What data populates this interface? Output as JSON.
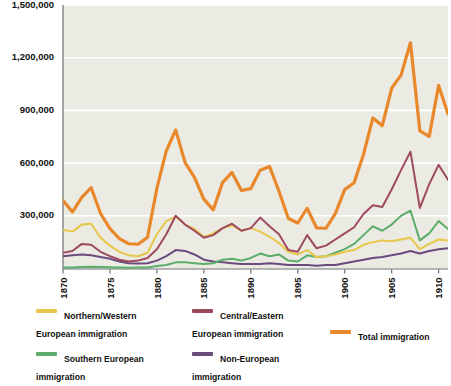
{
  "chart_data": {
    "type": "line",
    "title": "",
    "subtitle": "",
    "xlabel": "",
    "ylabel": "",
    "grid": true,
    "legend_position": "bottom",
    "xlim": [
      1870,
      1911
    ],
    "ylim": [
      0,
      1500000
    ],
    "x_ticks": [
      1870,
      1875,
      1880,
      1885,
      1890,
      1895,
      1900,
      1905,
      1910
    ],
    "x_tick_labels": [
      "1870",
      "1875",
      "1880",
      "1885",
      "1890",
      "1895",
      "1900",
      "1905",
      "1910"
    ],
    "y_ticks": [
      300000,
      600000,
      900000,
      1200000,
      1500000
    ],
    "y_tick_labels": [
      "300,000",
      "600,000",
      "900,000",
      "1,200,000",
      "1,500,000"
    ],
    "x": [
      1870,
      1871,
      1872,
      1873,
      1874,
      1875,
      1876,
      1877,
      1878,
      1879,
      1880,
      1881,
      1882,
      1883,
      1884,
      1885,
      1886,
      1887,
      1888,
      1889,
      1890,
      1891,
      1892,
      1893,
      1894,
      1895,
      1896,
      1897,
      1898,
      1899,
      1900,
      1901,
      1902,
      1903,
      1904,
      1905,
      1906,
      1907,
      1908,
      1909,
      1910,
      1911
    ],
    "series": [
      {
        "name": "Northern/Western European immigration",
        "color": "#E8C64A",
        "values": [
          220000,
          210000,
          250000,
          255000,
          175000,
          130000,
          95000,
          75000,
          70000,
          90000,
          195000,
          270000,
          295000,
          250000,
          225000,
          180000,
          200000,
          230000,
          245000,
          215000,
          230000,
          210000,
          180000,
          145000,
          95000,
          80000,
          105000,
          65000,
          70000,
          80000,
          95000,
          105000,
          135000,
          150000,
          160000,
          155000,
          165000,
          175000,
          110000,
          140000,
          165000,
          160000
        ]
      },
      {
        "name": "Southern European immigration",
        "color": "#5BAE6A",
        "values": [
          5000,
          6000,
          8000,
          10000,
          9000,
          7000,
          5000,
          4000,
          5000,
          6000,
          14000,
          20000,
          35000,
          35000,
          30000,
          25000,
          30000,
          50000,
          55000,
          45000,
          60000,
          85000,
          70000,
          80000,
          45000,
          40000,
          75000,
          65000,
          70000,
          90000,
          110000,
          140000,
          190000,
          240000,
          215000,
          250000,
          300000,
          330000,
          160000,
          200000,
          270000,
          225000
        ]
      },
      {
        "name": "Central/Eastern European immigration",
        "color": "#9E4A5E",
        "values": [
          90000,
          100000,
          140000,
          135000,
          95000,
          70000,
          50000,
          40000,
          45000,
          60000,
          110000,
          195000,
          300000,
          250000,
          215000,
          175000,
          190000,
          230000,
          255000,
          215000,
          230000,
          290000,
          240000,
          195000,
          105000,
          95000,
          190000,
          115000,
          130000,
          165000,
          200000,
          235000,
          310000,
          360000,
          350000,
          450000,
          560000,
          665000,
          345000,
          480000,
          590000,
          505000
        ]
      },
      {
        "name": "Non-European immigration",
        "color": "#6B4A7E",
        "values": [
          70000,
          75000,
          80000,
          75000,
          65000,
          55000,
          40000,
          30000,
          28000,
          30000,
          45000,
          70000,
          105000,
          100000,
          80000,
          50000,
          40000,
          35000,
          30000,
          25000,
          25000,
          25000,
          30000,
          25000,
          20000,
          20000,
          20000,
          15000,
          20000,
          20000,
          30000,
          40000,
          50000,
          60000,
          65000,
          75000,
          85000,
          100000,
          85000,
          100000,
          110000,
          115000
        ]
      },
      {
        "name": "Total immigration",
        "color": "#E8882B",
        "values": [
          387000,
          321000,
          405000,
          460000,
          313000,
          227000,
          170000,
          141000,
          138000,
          178000,
          457000,
          669000,
          789000,
          603000,
          519000,
          395000,
          334000,
          490000,
          547000,
          444000,
          455000,
          560000,
          580000,
          440000,
          285000,
          259000,
          343000,
          231000,
          229000,
          312000,
          449000,
          488000,
          649000,
          857000,
          813000,
          1026000,
          1101000,
          1285000,
          783000,
          752000,
          1042000,
          879000
        ]
      }
    ]
  },
  "legend": {
    "items": [
      {
        "label_line1": "Northern/Western",
        "label_line2": "European immigration",
        "color": "#E8C64A"
      },
      {
        "label_line1": "Central/Eastern",
        "label_line2": "European immigration",
        "color": "#9E4A5E"
      },
      {
        "label_line1": "Southern European",
        "label_line2": "immigration",
        "color": "#5BAE6A"
      },
      {
        "label_line1": "Non-European",
        "label_line2": "immigration",
        "color": "#6B4A7E"
      },
      {
        "label_line1": "Total immigration",
        "label_line2": "",
        "color": "#E8882B"
      }
    ]
  },
  "colors": {
    "plot_background": "#ebebe4",
    "gridline": "#ffffff",
    "axis": "#6f6f6f",
    "text": "#111111"
  }
}
